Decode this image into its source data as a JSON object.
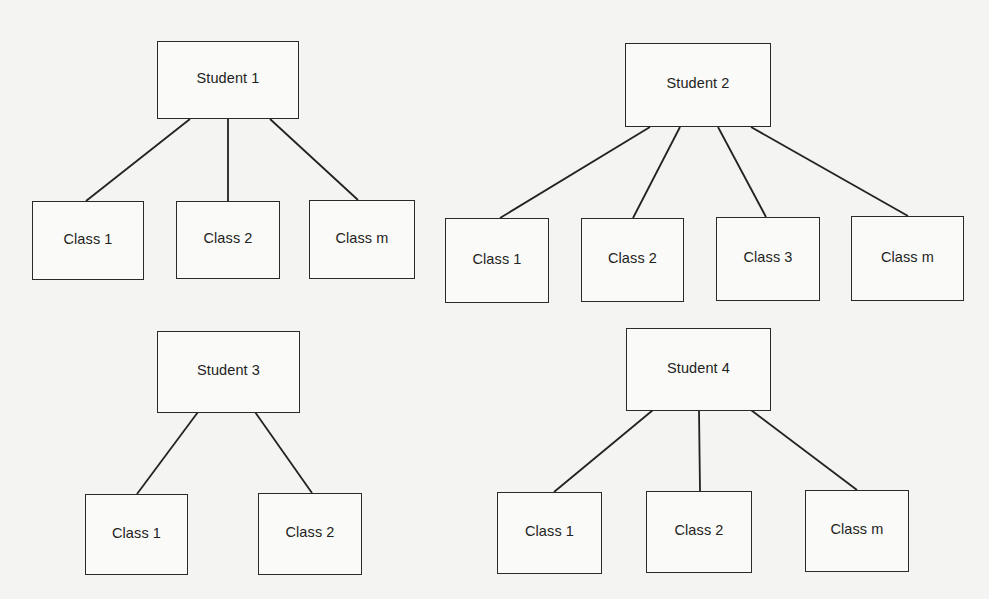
{
  "diagram": {
    "type": "hierarchy",
    "trees": [
      {
        "root": {
          "label": "Student 1",
          "box": [
            157,
            41,
            142,
            78
          ]
        },
        "children": [
          {
            "label": "Class 1",
            "box": [
              32,
              201,
              112,
              79
            ],
            "edge": [
              190,
              119,
              86,
              201
            ]
          },
          {
            "label": "Class 2",
            "box": [
              176,
              201,
              104,
              78
            ],
            "edge": [
              228,
              119,
              228,
              201
            ]
          },
          {
            "label": "Class m",
            "box": [
              309,
              200,
              106,
              79
            ],
            "edge": [
              270,
              119,
              358,
              200
            ]
          }
        ]
      },
      {
        "root": {
          "label": "Student 2",
          "box": [
            625,
            43,
            146,
            84
          ]
        },
        "children": [
          {
            "label": "Class 1",
            "box": [
              445,
              218,
              104,
              85
            ],
            "edge": [
              650,
              127,
              500,
              218
            ]
          },
          {
            "label": "Class 2",
            "box": [
              581,
              218,
              103,
              84
            ],
            "edge": [
              680,
              127,
              633,
              218
            ]
          },
          {
            "label": "Class 3",
            "box": [
              716,
              217,
              104,
              84
            ],
            "edge": [
              718,
              127,
              766,
              217
            ]
          },
          {
            "label": "Class m",
            "box": [
              851,
              216,
              113,
              85
            ],
            "edge": [
              751,
              127,
              908,
              216
            ]
          }
        ]
      },
      {
        "root": {
          "label": "Student 3",
          "box": [
            157,
            331,
            143,
            82
          ]
        },
        "children": [
          {
            "label": "Class 1",
            "box": [
              85,
              494,
              103,
              81
            ],
            "edge": [
              198,
              412,
              137,
              494
            ]
          },
          {
            "label": "Class 2",
            "box": [
              258,
              493,
              104,
              82
            ],
            "edge": [
              255,
              412,
              312,
              493
            ]
          }
        ]
      },
      {
        "root": {
          "label": "Student 4",
          "box": [
            626,
            328,
            145,
            83
          ]
        },
        "children": [
          {
            "label": "Class 1",
            "box": [
              497,
              492,
              105,
              82
            ],
            "edge": [
              653,
              410,
              554,
              492
            ]
          },
          {
            "label": "Class 2",
            "box": [
              646,
              491,
              106,
              82
            ],
            "edge": [
              699,
              410,
              700,
              491
            ]
          },
          {
            "label": "Class m",
            "box": [
              805,
              490,
              104,
              82
            ],
            "edge": [
              751,
              410,
              857,
              490
            ]
          }
        ]
      }
    ]
  }
}
